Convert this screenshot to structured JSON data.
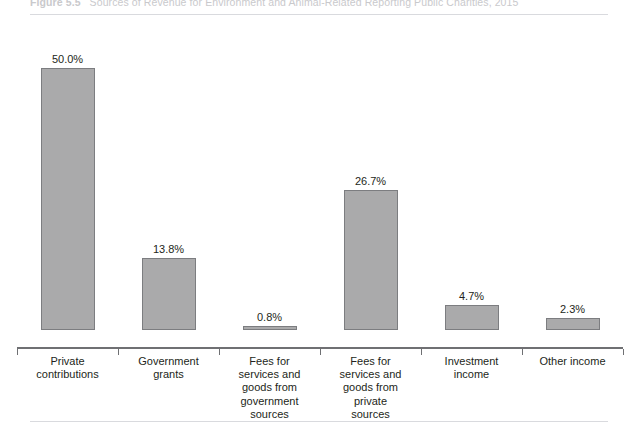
{
  "figure": {
    "number": "Figure 5.5",
    "title": "Sources of Revenue for Environment and Animal-Related Reporting Public Charities, 2015"
  },
  "colors": {
    "bar_fill": "#aaaaab",
    "bar_border": "#7c7d80",
    "axis": "#6f7073",
    "text": "#231f20",
    "rule": "#d9dade",
    "title_text": "#c9c9cc"
  },
  "chart_data": {
    "type": "bar",
    "xlabel": "",
    "ylabel": "",
    "ylim": [
      0,
      54
    ],
    "grid": false,
    "legend": "none",
    "categories": [
      "Private contributions",
      "Government grants",
      "Fees for services and goods from government sources",
      "Fees for services and goods from private sources",
      "Investment income",
      "Other income"
    ],
    "category_lines": [
      [
        "Private",
        "contributions"
      ],
      [
        "Government",
        "grants"
      ],
      [
        "Fees for",
        "services and",
        "goods from",
        "government",
        "sources"
      ],
      [
        "Fees for",
        "services and",
        "goods from",
        "private",
        "sources"
      ],
      [
        "Investment",
        "income"
      ],
      [
        "Other income"
      ]
    ],
    "values": [
      50.0,
      13.8,
      0.8,
      26.7,
      4.7,
      2.3
    ],
    "data_labels": [
      "50.0%",
      "13.8%",
      "0.8%",
      "26.7%",
      "4.7%",
      "2.3%"
    ]
  }
}
